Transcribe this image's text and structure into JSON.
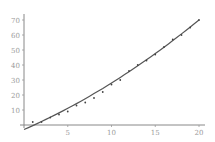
{
  "chart_data": {
    "type": "scatter",
    "title": "",
    "xlabel": "",
    "ylabel": "",
    "xlim": [
      0,
      20
    ],
    "ylim": [
      -4,
      72
    ],
    "grid": false,
    "legend": null,
    "x_ticks": [
      5,
      10,
      15,
      20
    ],
    "y_ticks": [
      10,
      20,
      30,
      40,
      50,
      60,
      70
    ],
    "x_tick_labels": [
      "5",
      "10",
      "15",
      "20"
    ],
    "y_tick_labels": [
      "10",
      "20",
      "30",
      "40",
      "50",
      "60",
      "70"
    ],
    "series": [
      {
        "name": "data",
        "kind": "scatter",
        "x": [
          1,
          2,
          3,
          4,
          5,
          6,
          7,
          8,
          9,
          10,
          11,
          12,
          13,
          14,
          15,
          16,
          17,
          18,
          19,
          20
        ],
        "y": [
          2,
          2,
          5,
          7,
          9,
          13,
          15,
          18,
          22,
          27,
          30,
          36,
          40,
          43,
          47,
          52,
          57,
          60,
          65,
          70
        ]
      },
      {
        "name": "fit",
        "kind": "line",
        "equation": "y = -3 + 2.55x + 0.055x^2",
        "x": [
          0,
          2,
          4,
          6,
          8,
          10,
          12,
          14,
          16,
          18,
          20
        ],
        "y": [
          -3,
          2.3,
          8.1,
          14.3,
          20.9,
          28.0,
          35.5,
          43.5,
          51.9,
          52.5,
          70
        ]
      }
    ],
    "colors": {
      "axis": "#888888",
      "labels": "#9a9a9a",
      "curve": "#555555",
      "points": "#444444"
    }
  }
}
